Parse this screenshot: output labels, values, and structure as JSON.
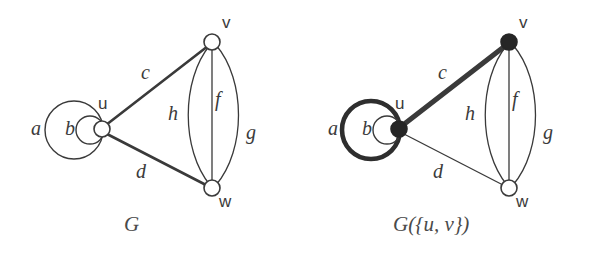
{
  "figure": {
    "background_color": "#ffffff",
    "ink_color": "#3a3a3a",
    "panels": [
      {
        "id": "left",
        "caption": "G",
        "caption_parts": {
          "base": "G",
          "arg": ""
        },
        "vertices": [
          {
            "name": "u",
            "label": "u",
            "x": 102,
            "y": 129,
            "r": 8,
            "fill": "open"
          },
          {
            "name": "v",
            "label": "v",
            "x": 212,
            "y": 42,
            "r": 8,
            "fill": "open"
          },
          {
            "name": "w",
            "label": "w",
            "x": 212,
            "y": 188,
            "r": 8,
            "fill": "open"
          }
        ],
        "vertex_labels": [
          {
            "text": "u",
            "x": 98,
            "y": 95
          },
          {
            "text": "v",
            "x": 222,
            "y": 14
          },
          {
            "text": "w",
            "x": 219,
            "y": 193
          }
        ],
        "edges": [
          {
            "name": "a",
            "kind": "loop",
            "endpoints": [
              "u",
              "u"
            ],
            "weight": "thin",
            "label": "a",
            "label_x": 31,
            "label_y": 118
          },
          {
            "name": "b",
            "kind": "loop",
            "endpoints": [
              "u",
              "u"
            ],
            "weight": "thin",
            "label": "b",
            "label_x": 65,
            "label_y": 118
          },
          {
            "name": "c",
            "kind": "straight",
            "endpoints": [
              "u",
              "v"
            ],
            "weight": "medium",
            "label": "c",
            "label_x": 141,
            "label_y": 62
          },
          {
            "name": "d",
            "kind": "straight",
            "endpoints": [
              "u",
              "w"
            ],
            "weight": "medium",
            "label": "d",
            "label_x": 136,
            "label_y": 161
          },
          {
            "name": "h",
            "kind": "curve",
            "endpoints": [
              "v",
              "w"
            ],
            "weight": "thin",
            "label": "h",
            "label_x": 168,
            "label_y": 103
          },
          {
            "name": "f",
            "kind": "straight",
            "endpoints": [
              "v",
              "w"
            ],
            "weight": "thin",
            "label": "f",
            "label_x": 215,
            "label_y": 89
          },
          {
            "name": "g",
            "kind": "curve",
            "endpoints": [
              "v",
              "w"
            ],
            "weight": "thin",
            "label": "g",
            "label_x": 246,
            "label_y": 122
          }
        ]
      },
      {
        "id": "right",
        "caption": "G({u, v})",
        "caption_parts": {
          "base": "G",
          "arg": "({u, v})"
        },
        "vertices": [
          {
            "name": "u",
            "label": "u",
            "x": 399,
            "y": 129,
            "r": 8,
            "fill": "filled"
          },
          {
            "name": "v",
            "label": "v",
            "x": 509,
            "y": 42,
            "r": 8,
            "fill": "filled"
          },
          {
            "name": "w",
            "label": "w",
            "x": 509,
            "y": 188,
            "r": 8,
            "fill": "open"
          }
        ],
        "vertex_labels": [
          {
            "text": "u",
            "x": 395,
            "y": 95
          },
          {
            "text": "v",
            "x": 519,
            "y": 14
          },
          {
            "text": "w",
            "x": 516,
            "y": 193
          }
        ],
        "edges": [
          {
            "name": "a",
            "kind": "loop",
            "endpoints": [
              "u",
              "u"
            ],
            "weight": "bold",
            "label": "a",
            "label_x": 328,
            "label_y": 118
          },
          {
            "name": "b",
            "kind": "loop",
            "endpoints": [
              "u",
              "u"
            ],
            "weight": "thin",
            "label": "b",
            "label_x": 362,
            "label_y": 118
          },
          {
            "name": "c",
            "kind": "straight",
            "endpoints": [
              "u",
              "v"
            ],
            "weight": "bold",
            "label": "c",
            "label_x": 438,
            "label_y": 62
          },
          {
            "name": "d",
            "kind": "straight",
            "endpoints": [
              "u",
              "w"
            ],
            "weight": "thin",
            "label": "d",
            "label_x": 433,
            "label_y": 161
          },
          {
            "name": "h",
            "kind": "curve",
            "endpoints": [
              "v",
              "w"
            ],
            "weight": "thin",
            "label": "h",
            "label_x": 465,
            "label_y": 103
          },
          {
            "name": "f",
            "kind": "straight",
            "endpoints": [
              "v",
              "w"
            ],
            "weight": "thin",
            "label": "f",
            "label_x": 512,
            "label_y": 89
          },
          {
            "name": "g",
            "kind": "curve",
            "endpoints": [
              "v",
              "w"
            ],
            "weight": "thin",
            "label": "g",
            "label_x": 543,
            "label_y": 122
          }
        ]
      }
    ],
    "captions": [
      {
        "text": "G",
        "x": 124,
        "y": 214
      },
      {
        "text": "G({u, v})",
        "x": 393,
        "y": 214
      }
    ]
  }
}
